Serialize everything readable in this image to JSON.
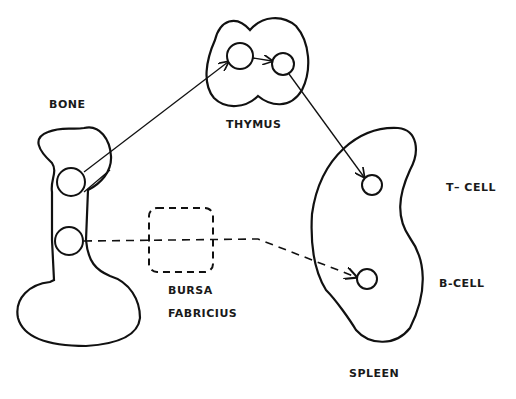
{
  "labels": {
    "bone": "BONE",
    "thymus": "THYMUS",
    "t_cell": "T– CELL",
    "b_cell": "B-CELL",
    "bursa_line1": "BURSA",
    "bursa_line2": "FABRICIUS",
    "spleen": "SPLEEN"
  },
  "colors": {
    "stroke": "#111111",
    "background": "#ffffff"
  }
}
